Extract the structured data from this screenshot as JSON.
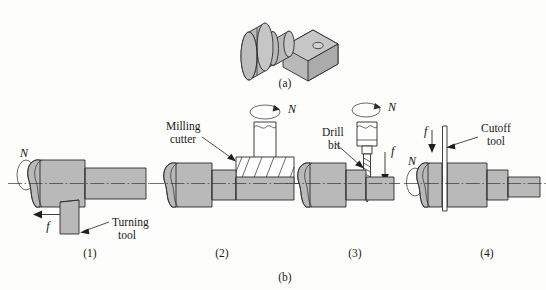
{
  "figure": {
    "caption_a": "(a)",
    "caption_b": "(b)",
    "panels": [
      {
        "id": "1",
        "caption": "(1)",
        "operation": "turning",
        "tool_label": "Turning\ntool",
        "tool_label_line1": "Turning",
        "tool_label_line2": "tool",
        "rotation_symbol": "N",
        "feed_symbol": "f"
      },
      {
        "id": "2",
        "caption": "(2)",
        "operation": "milling",
        "tool_label_line1": "Milling",
        "tool_label_line2": "cutter",
        "rotation_symbol": "N",
        "feed_symbol": ""
      },
      {
        "id": "3",
        "caption": "(3)",
        "operation": "drilling",
        "tool_label_line1": "Drill",
        "tool_label_line2": "bit",
        "rotation_symbol": "N",
        "feed_symbol": "f"
      },
      {
        "id": "4",
        "caption": "(4)",
        "operation": "cutoff",
        "tool_label_line1": "Cutoff",
        "tool_label_line2": "tool",
        "rotation_symbol": "N",
        "feed_symbol": "f"
      }
    ]
  },
  "symbols": {
    "N": "N",
    "f": "f"
  },
  "colors": {
    "metal_fill": "#b9b9b9",
    "metal_fill_dark": "#ababab",
    "metal_fill_light": "#c6c6c6",
    "outline": "#2b2b2b",
    "background": "#fdfdfc",
    "tool_white": "#fefefe"
  }
}
